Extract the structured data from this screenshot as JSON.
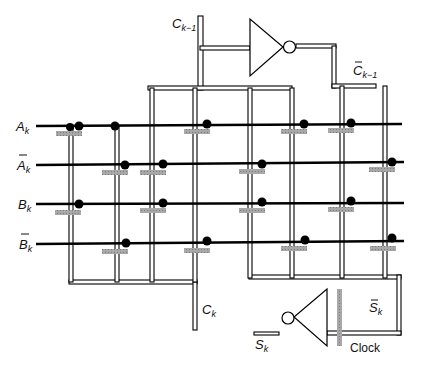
{
  "diagram": {
    "type": "PLA-style adder circuit schematic (one bit stage)",
    "colors": {
      "wire": "#000000",
      "double_rail": "#000000",
      "gate_bar": "#9a9a9a",
      "background": "#ffffff"
    },
    "input_lines": [
      {
        "id": "A_k",
        "label": "A",
        "sub": "k",
        "overbar": false,
        "y": 124
      },
      {
        "id": "A_k_bar",
        "label": "A",
        "sub": "k",
        "overbar": true,
        "y": 163
      },
      {
        "id": "B_k",
        "label": "B",
        "sub": "k",
        "overbar": false,
        "y": 204
      },
      {
        "id": "B_k_bar",
        "label": "B",
        "sub": "k",
        "overbar": true,
        "y": 243
      }
    ],
    "labels": {
      "carry_in": {
        "main": "C",
        "sub": "k−1",
        "overbar": false
      },
      "carry_in_bar": {
        "main": "C",
        "sub": "k−1",
        "overbar": true
      },
      "carry_out": {
        "main": "C",
        "sub": "k",
        "overbar": false
      },
      "sum": {
        "main": "S",
        "sub": "k",
        "overbar": false
      },
      "sum_bar": {
        "main": "S",
        "sub": "k",
        "overbar": true
      },
      "clock": "Clock"
    },
    "components": [
      {
        "name": "inverter-carry-in",
        "input": "C_k-1",
        "output": "C_k-1_bar"
      },
      {
        "name": "inverter-sum",
        "input": "S_k_bar (clocked)",
        "output": "S_k"
      },
      {
        "name": "clock-pass-gate",
        "label": "Clock"
      }
    ],
    "transistor_sites": 18
  }
}
